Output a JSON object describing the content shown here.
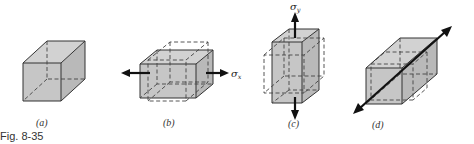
{
  "figure": {
    "caption": "Fig. 8-35",
    "panels": [
      {
        "id": "a",
        "label": "(a)",
        "description": "unstressed cube"
      },
      {
        "id": "b",
        "label": "(b)",
        "description": "cube under uniaxial stress in x",
        "stress_label": "σ",
        "stress_subscript": "x"
      },
      {
        "id": "c",
        "label": "(c)",
        "description": "cube under uniaxial stress in y",
        "stress_label": "σ",
        "stress_subscript": "y"
      },
      {
        "id": "d",
        "label": "(d)",
        "description": "cube under uniaxial stress in z (depth)"
      }
    ],
    "colors": {
      "face_fill": "#c6c6c6",
      "edge": "#333333",
      "arrow": "#111111"
    }
  }
}
